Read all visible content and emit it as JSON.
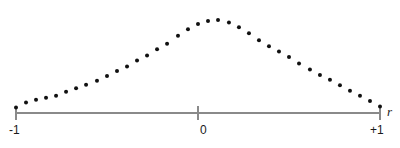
{
  "figure": {
    "axis_label_x": "r",
    "dot_color": "#111111",
    "axis_color": "#8a8a8a",
    "background_color": "#ffffff"
  },
  "axis": {
    "ticks": [
      {
        "label": "-1",
        "value": -1
      },
      {
        "label": "0",
        "value": 0
      },
      {
        "label": "+1",
        "value": 1
      }
    ]
  },
  "chart_data": {
    "type": "scatter",
    "title": "",
    "subtitle": "",
    "xlabel": "r",
    "ylabel": "",
    "xlim": [
      -1,
      1
    ],
    "ylim": [
      0,
      1
    ],
    "grid": false,
    "legend": "none",
    "xticks": [
      -1,
      0,
      1
    ],
    "xticklabels": [
      "-1",
      "0",
      "+1"
    ],
    "yticks": [],
    "yticklabels": [],
    "annotations": [],
    "marker": "filled-circle",
    "marker_size_px": 4,
    "n_points": 37,
    "x": [
      -1.0,
      -0.945,
      -0.89,
      -0.835,
      -0.78,
      -0.725,
      -0.67,
      -0.615,
      -0.555,
      -0.5,
      -0.445,
      -0.39,
      -0.335,
      -0.28,
      -0.225,
      -0.17,
      -0.11,
      -0.055,
      0.0,
      0.055,
      0.11,
      0.17,
      0.225,
      0.28,
      0.335,
      0.39,
      0.445,
      0.5,
      0.555,
      0.615,
      0.67,
      0.725,
      0.78,
      0.835,
      0.89,
      0.945,
      1.0
    ],
    "y": [
      0.055,
      0.105,
      0.135,
      0.155,
      0.175,
      0.215,
      0.25,
      0.285,
      0.325,
      0.375,
      0.425,
      0.47,
      0.53,
      0.58,
      0.645,
      0.7,
      0.78,
      0.845,
      0.9,
      0.93,
      0.94,
      0.915,
      0.865,
      0.805,
      0.735,
      0.675,
      0.62,
      0.565,
      0.5,
      0.44,
      0.385,
      0.335,
      0.28,
      0.225,
      0.175,
      0.12,
      0.065
    ]
  }
}
